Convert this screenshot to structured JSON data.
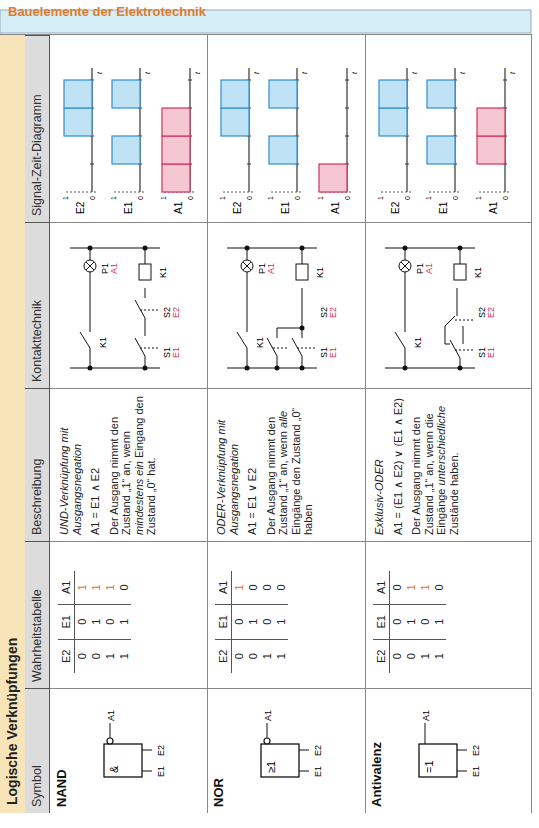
{
  "header": {
    "title": "Bauelemente der Elektrotechnik",
    "title_color": "#e07b2a",
    "bar_color": "#d6eef8"
  },
  "section": {
    "title": "Logische Verknüpfungen",
    "strip_color": "#f7e4b8"
  },
  "columns": [
    "Symbol",
    "Wahrheitstabelle",
    "Beschreibung",
    "Kontakttechnik",
    "Signal-Zeit-Diagramm"
  ],
  "truth_headers": [
    "E2",
    "E1",
    "A1"
  ],
  "rows": [
    {
      "name": "NAND",
      "symbol": "&",
      "negated_output": true,
      "truth": [
        [
          "0",
          "0",
          "1"
        ],
        [
          "0",
          "1",
          "1"
        ],
        [
          "1",
          "0",
          "1"
        ],
        [
          "1",
          "1",
          "0"
        ]
      ],
      "desc_title": "UND-Verknüpfung mit Ausgangsnegation",
      "formula": "A1 = E1 ∧ E2",
      "desc_a": "Der Ausgang nimmt den Zustand „1“ an, wenn",
      "desc_em": "mindestens ein",
      "desc_b": "Eingang den Zustand „0“ hat.",
      "signals": {
        "E2": [
          0,
          0,
          1,
          1
        ],
        "E1": [
          0,
          1,
          0,
          1
        ],
        "A1": [
          1,
          1,
          1,
          0
        ]
      }
    },
    {
      "name": "NOR",
      "symbol": "≥1",
      "negated_output": true,
      "truth": [
        [
          "0",
          "0",
          "1"
        ],
        [
          "0",
          "1",
          "0"
        ],
        [
          "1",
          "0",
          "0"
        ],
        [
          "1",
          "1",
          "0"
        ]
      ],
      "desc_title": "ODER-Verknüpfung mit Ausgangsnegation",
      "formula": "A1 = E1 ∨ E2",
      "desc_a": "Der Ausgang nimmt den Zustand „1“ an, wenn",
      "desc_em": "alle",
      "desc_b": "Eingänge den Zustand „0“ haben",
      "signals": {
        "E2": [
          0,
          0,
          1,
          1
        ],
        "E1": [
          0,
          1,
          0,
          1
        ],
        "A1": [
          1,
          0,
          0,
          0
        ]
      }
    },
    {
      "name": "Antivalenz",
      "symbol": "=1",
      "negated_output": false,
      "truth": [
        [
          "0",
          "0",
          "0"
        ],
        [
          "0",
          "1",
          "1"
        ],
        [
          "1",
          "0",
          "1"
        ],
        [
          "1",
          "1",
          "0"
        ]
      ],
      "desc_title": "Exklusiv-ODER",
      "formula": "A1 = (E1 ∧ E2) ∨ (E1 ∧ E2)",
      "desc_a": "Der Ausgang nimmt den Zustand „1“ an, wenn die Eingänge",
      "desc_em": "unterschiedliche",
      "desc_b": "Zustände haben.",
      "signals": {
        "E2": [
          0,
          0,
          1,
          1
        ],
        "E1": [
          0,
          1,
          0,
          1
        ],
        "A1": [
          0,
          1,
          1,
          0
        ]
      }
    }
  ],
  "circuit_labels": {
    "S1": "S1",
    "S2": "S2",
    "E1": "E1",
    "E2": "E2",
    "K1": "K1",
    "P1": "P1",
    "A1": "A1"
  },
  "signal_axis": {
    "one": "1",
    "zero": "0",
    "t": "t"
  },
  "colors": {
    "input_fill": "#bfe3f5",
    "input_stroke": "#2f8fd0",
    "output_fill": "#f5c7d3",
    "output_stroke": "#d6305a",
    "highlight": "#e0702a",
    "label_red": "#d6305a"
  }
}
